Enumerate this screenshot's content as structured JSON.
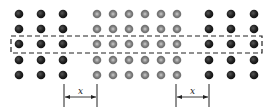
{
  "diagram": {
    "rows_y": [
      14,
      29,
      44,
      60,
      75
    ],
    "left_dark_columns_x": [
      19,
      41,
      63
    ],
    "center_gray_columns_x": [
      97,
      113,
      129,
      145,
      161,
      177
    ],
    "right_dark_columns_x": [
      209,
      231,
      254
    ],
    "dark_color": "#1e1e1e",
    "gray_color": "#8a8a8a",
    "dashed_box": {
      "x1": 11,
      "y1": 36,
      "x2": 262,
      "y2": 53
    },
    "dimensions": [
      {
        "label": "x",
        "x1": 64,
        "x2": 97,
        "y": 97
      },
      {
        "label": "x",
        "x1": 176,
        "x2": 209,
        "y": 97
      }
    ]
  }
}
